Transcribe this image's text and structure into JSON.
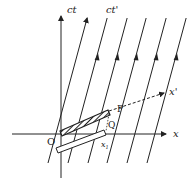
{
  "diagram": {
    "type": "minkowski-spacetime-diagram",
    "labels": {
      "ct_axis": "ct",
      "ct_prime_axis": "ct'",
      "x_axis": "x",
      "x_prime_axis": "x'",
      "origin": "O",
      "point_p": "P",
      "point_q": "Q",
      "x1": "x",
      "x1_sub": "1"
    },
    "worldline_count": 6,
    "colors": {
      "ink": "#222222",
      "background": "#ffffff"
    }
  }
}
